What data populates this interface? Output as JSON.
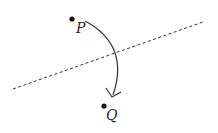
{
  "diagram": {
    "points": [
      {
        "label": "P",
        "x": 72,
        "y": 19
      },
      {
        "label": "Q",
        "x": 104,
        "y": 106
      }
    ],
    "mirror_line": {
      "style": "dashed",
      "x1": 13,
      "y1": 89,
      "x2": 203,
      "y2": 22
    },
    "arrow": {
      "from": "P",
      "to": "Q",
      "shape": "arc"
    },
    "colors": {
      "ink": "#222222",
      "background": "#ffffff"
    }
  }
}
